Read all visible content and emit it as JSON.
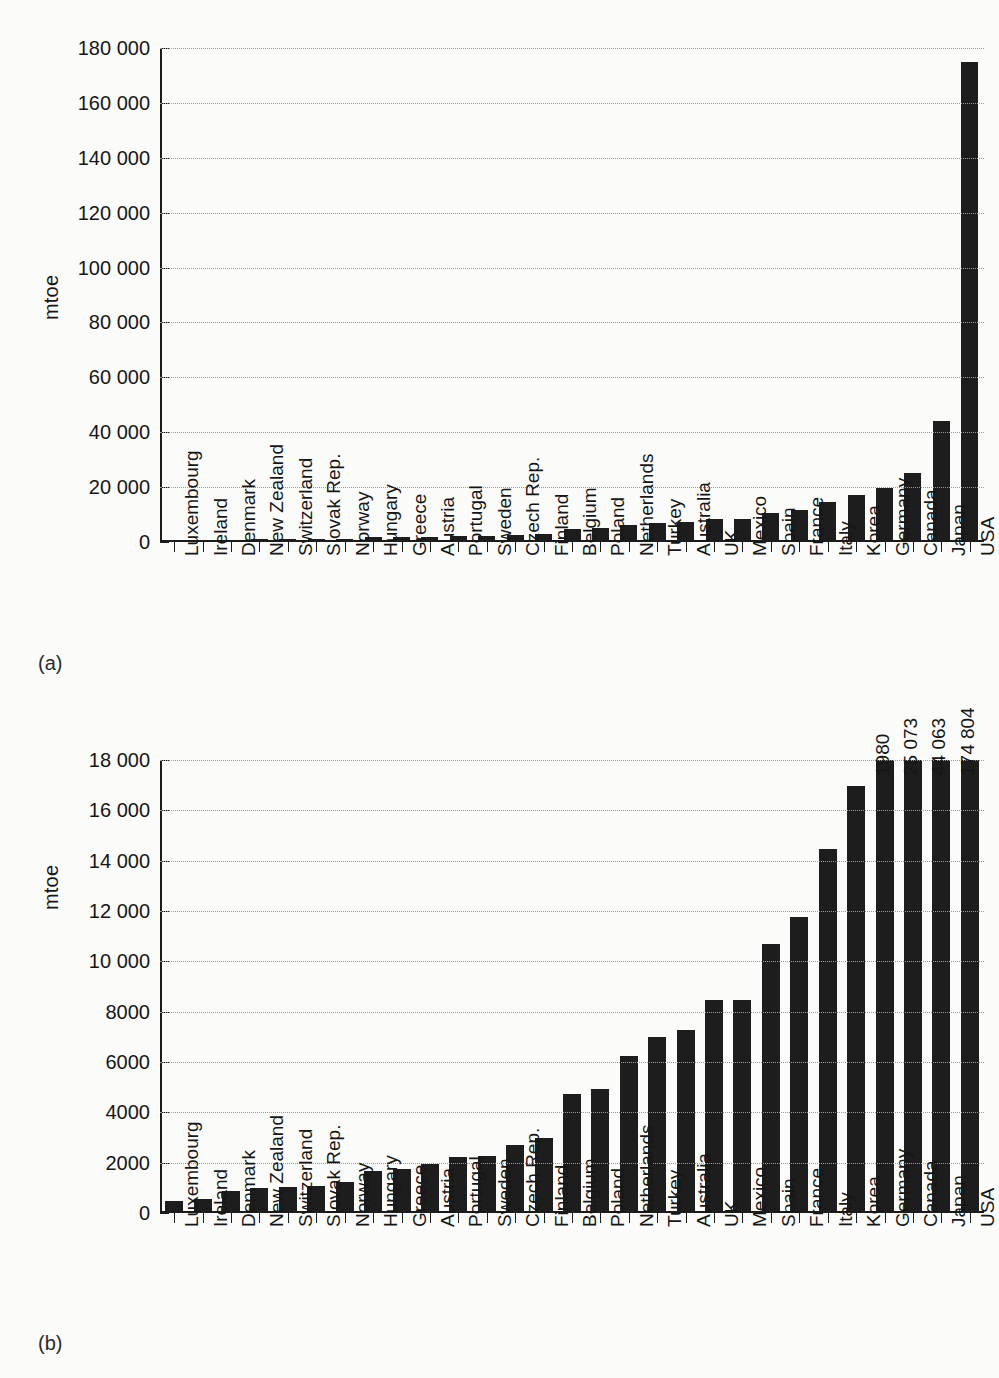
{
  "figure": {
    "panel_a_tag": "(a)",
    "panel_b_tag": "(b)"
  },
  "chart_data": [
    {
      "id": "panel-a",
      "type": "bar",
      "title": "",
      "xlabel": "",
      "ylabel": "mtoe",
      "ylim": [
        0,
        180000
      ],
      "ytick_values": [
        0,
        20000,
        40000,
        60000,
        80000,
        100000,
        120000,
        140000,
        160000,
        180000
      ],
      "ytick_labels": [
        "0",
        "20 000",
        "40 000",
        "60 000",
        "80 000",
        "100 000",
        "120 000",
        "140 000",
        "160 000",
        "180 000"
      ],
      "grid": true,
      "legend": "none",
      "categories": [
        "Luxembourg",
        "Ireland",
        "Denmark",
        "New Zealand",
        "Switzerland",
        "Slovak Rep.",
        "Norway",
        "Hungary",
        "Greece",
        "Austria",
        "Portugal",
        "Sweden",
        "Czech Rep.",
        "Finland",
        "Belgium",
        "Poland",
        "Netherlands",
        "Turkey",
        "Australia",
        "UK",
        "Mexico",
        "Spain",
        "France",
        "Italy",
        "Korea",
        "Germany",
        "Canada",
        "Japan",
        "USA"
      ],
      "values": [
        480,
        570,
        870,
        980,
        1020,
        1080,
        1240,
        1650,
        1740,
        1930,
        2230,
        2280,
        2700,
        2970,
        4730,
        4940,
        6250,
        6980,
        7270,
        8470,
        8470,
        10680,
        11770,
        14480,
        16980,
        19800,
        25073,
        44063,
        174804
      ]
    },
    {
      "id": "panel-b",
      "type": "bar",
      "title": "",
      "xlabel": "",
      "ylabel": "mtoe",
      "ylim": [
        0,
        18000
      ],
      "ytick_values": [
        0,
        2000,
        4000,
        6000,
        8000,
        10000,
        12000,
        14000,
        16000,
        18000
      ],
      "ytick_labels": [
        "0",
        "2000",
        "4000",
        "6000",
        "8000",
        "10 000",
        "12 000",
        "14 000",
        "16 000",
        "18 000"
      ],
      "grid": true,
      "legend": "none",
      "note": "Bars for Germany, Canada, Japan and USA exceed the axis maximum and are clipped; their actual values are printed above the bars.",
      "categories": [
        "Luxembourg",
        "Ireland",
        "Denmark",
        "New Zealand",
        "Switzerland",
        "Slovak Rep.",
        "Norway",
        "Hungary",
        "Greece",
        "Austria",
        "Portugal",
        "Sweden",
        "Czech Rep.",
        "Finland",
        "Belgium",
        "Poland",
        "Netherlands",
        "Turkey",
        "Australia",
        "UK",
        "Mexico",
        "Spain",
        "France",
        "Italy",
        "Korea",
        "Germany",
        "Canada",
        "Japan",
        "USA"
      ],
      "values": [
        480,
        570,
        870,
        980,
        1020,
        1080,
        1240,
        1650,
        1740,
        1930,
        2230,
        2280,
        2700,
        2970,
        4730,
        4940,
        6250,
        6980,
        7270,
        8470,
        8470,
        10680,
        11770,
        14480,
        16980,
        19800,
        25073,
        44063,
        174804
      ],
      "clipped_labels": [
        {
          "category": "Germany",
          "label": "19 80",
          "text": "1980"
        },
        {
          "category": "Canada",
          "label": "25 073",
          "text": "25 073"
        },
        {
          "category": "Japan",
          "label": "44 063",
          "text": "44 063"
        },
        {
          "category": "USA",
          "label": "174 804",
          "text": "174 804"
        }
      ]
    }
  ],
  "colors": {
    "bar": "#1d1d1d",
    "axis": "#1a1a1a",
    "grid": "#9b9b9b",
    "background": "#fbfbfa",
    "text": "#161616"
  }
}
